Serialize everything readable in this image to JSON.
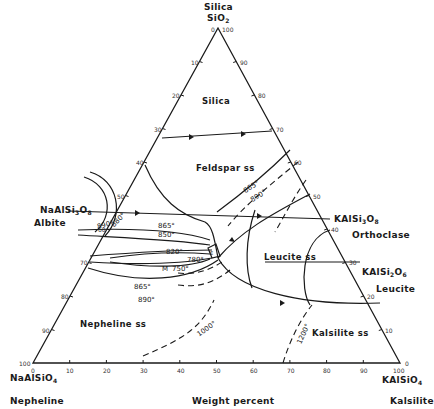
{
  "axis_label": "Weight percent",
  "vertices": {
    "top": {
      "name": "Silica",
      "formula_main": "SiO",
      "formula_sub": "2"
    },
    "left": {
      "name": "Nepheline",
      "formula_main": "NaAlSiO",
      "formula_sub": "4"
    },
    "right": {
      "name": "Kalsilite",
      "formula_main": "KAlSiO",
      "formula_sub": "4"
    }
  },
  "side_compounds": {
    "albite": {
      "name": "Albite",
      "f1": "NaAlSi",
      "s1": "3",
      "f2": "O",
      "s2": "8"
    },
    "orthoclase": {
      "name": "Orthoclase",
      "f1": "KAlSi",
      "s1": "3",
      "f2": "O",
      "s2": "8"
    },
    "leucite": {
      "name": "Leucite",
      "f1": "KAlSi",
      "s1": "2",
      "f2": "O",
      "s2": "6"
    }
  },
  "fields": {
    "silica": "Silica",
    "feldspar": "Feldspar ss",
    "leucite": "Leucite ss",
    "nepheline": "Nepheline ss",
    "kalsilite": "Kalsilite ss"
  },
  "ticks": {
    "bottom": [
      "0",
      "10",
      "20",
      "30",
      "40",
      "50",
      "60",
      "70",
      "80",
      "90",
      "100"
    ],
    "left": [
      "0",
      "10",
      "20",
      "30",
      "40",
      "50",
      "60",
      "70",
      "80",
      "90",
      "100"
    ],
    "right": [
      "100",
      "90",
      "80",
      "70",
      "60",
      "50",
      "40",
      "30",
      "20",
      "10",
      "0"
    ]
  },
  "isotherms": {
    "t865_upper": "865°",
    "t890_upper": "890°",
    "t890_albite": "890°",
    "t880": "880°",
    "t865_mid": "865°",
    "t850": "850°",
    "t820": "820°",
    "t780": "780°",
    "t750": "750°",
    "t865_low": "865°",
    "t890_low": "890°",
    "t1000": "1000°",
    "t1200": "1200°"
  },
  "minimum_point": "M",
  "eutectic_mark": "E"
}
